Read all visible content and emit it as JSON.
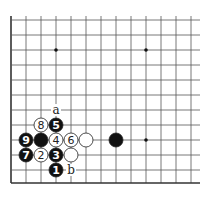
{
  "diagram": {
    "grid": {
      "origin_x": 11,
      "origin_y": 20,
      "spacing": 15,
      "cols": 13,
      "rows": 12,
      "right_edge_x": 200,
      "bottom_edge_y": 183,
      "left_edge": true,
      "bottom_edge": true
    },
    "star_points": [
      [
        3,
        2
      ],
      [
        9,
        2
      ],
      [
        9,
        8
      ]
    ],
    "stones": [
      {
        "col": 2,
        "row": 7,
        "color": "white",
        "label": "8"
      },
      {
        "col": 3,
        "row": 7,
        "color": "black",
        "label": "5"
      },
      {
        "col": 1,
        "row": 8,
        "color": "black",
        "label": "9"
      },
      {
        "col": 2,
        "row": 8,
        "color": "black",
        "label": ""
      },
      {
        "col": 3,
        "row": 8,
        "color": "white",
        "label": "4"
      },
      {
        "col": 4,
        "row": 8,
        "color": "white",
        "label": "6"
      },
      {
        "col": 5,
        "row": 8,
        "color": "white",
        "label": ""
      },
      {
        "col": 7,
        "row": 8,
        "color": "black",
        "label": ""
      },
      {
        "col": 1,
        "row": 9,
        "color": "black",
        "label": "7"
      },
      {
        "col": 2,
        "row": 9,
        "color": "white",
        "label": "2"
      },
      {
        "col": 3,
        "row": 9,
        "color": "black",
        "label": "3"
      },
      {
        "col": 4,
        "row": 9,
        "color": "white",
        "label": ""
      },
      {
        "col": 3,
        "row": 10,
        "color": "black",
        "label": "1"
      }
    ],
    "markers": [
      {
        "col": 3,
        "row": 6,
        "label": "a"
      },
      {
        "col": 4,
        "row": 10,
        "label": "b"
      }
    ],
    "colors": {
      "line": "#555555",
      "edge": "#333333",
      "black": "#111111",
      "white": "#ffffff"
    }
  }
}
